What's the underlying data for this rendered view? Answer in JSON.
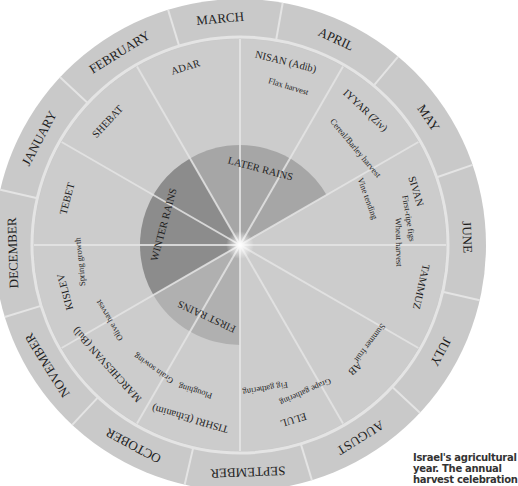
{
  "title": "Israel's agricultural year",
  "geometry": {
    "cx": 240,
    "cy": 245,
    "outer_r": 246,
    "ring_r": 206,
    "rain_r": 100
  },
  "colors": {
    "outer_ring": "#c9c9c9",
    "inner_ring": "#cccccc",
    "divider": "#e4e4e4",
    "later_rains": "#a6a6a6",
    "winter_rains": "#8c8c8c",
    "first_rains": "#b0b0b0",
    "text": "#1e1e1e"
  },
  "months": [
    {
      "label": "MARCH",
      "angle": -5
    },
    {
      "label": "APRIL",
      "angle": 25
    },
    {
      "label": "MAY",
      "angle": 56
    },
    {
      "label": "JUNE",
      "angle": 88
    },
    {
      "label": "JULY",
      "angle": 118
    },
    {
      "label": "AUGUST",
      "angle": 148
    },
    {
      "label": "SEPTEMBER",
      "angle": 178
    },
    {
      "label": "OCTOBER",
      "angle": 208
    },
    {
      "label": "NOVEMBER",
      "angle": 238
    },
    {
      "label": "DECEMBER",
      "angle": 268
    },
    {
      "label": "JANUARY",
      "angle": 298
    },
    {
      "label": "FEBRUARY",
      "angle": 328
    }
  ],
  "hebrew_months": [
    {
      "label": "NISAN (Adib)",
      "angle": 14,
      "r": 188
    },
    {
      "label": "IYYAR (Ziv)",
      "angle": 43,
      "r": 183
    },
    {
      "label": "SIVAN",
      "angle": 73,
      "r": 183
    },
    {
      "label": "TAMMUZ",
      "angle": 103,
      "r": 185
    },
    {
      "label": "AB",
      "angle": 137,
      "r": 168
    },
    {
      "label": "ELUL",
      "angle": 163,
      "r": 182
    },
    {
      "label": "TISHRI (Ethanim)",
      "angle": 196,
      "r": 180
    },
    {
      "label": "MARCHESVAN (Bul)",
      "angle": 228,
      "r": 178
    },
    {
      "label": "KISLEV",
      "angle": 255,
      "r": 180
    },
    {
      "label": "TEBET",
      "angle": 285,
      "r": 178
    },
    {
      "label": "SHEBAT",
      "angle": 313,
      "r": 180
    },
    {
      "label": "ADAR",
      "angle": 343,
      "r": 185
    }
  ],
  "activities": [
    {
      "label": "Flax harvest",
      "angle": 17,
      "r": 165
    },
    {
      "label": "Cereal/Barley harvest",
      "angle": 50,
      "r": 150
    },
    {
      "label": "Vine tending",
      "angle": 70,
      "r": 135
    },
    {
      "label": "First-ripe figs",
      "angle": 81,
      "r": 170
    },
    {
      "label": "Wheat harvest",
      "angle": 89,
      "r": 158
    },
    {
      "label": "Summer fruit",
      "angle": 127,
      "r": 162
    },
    {
      "label": "Grape gathering",
      "angle": 156,
      "r": 160
    },
    {
      "label": "Fig gathering",
      "angle": 170,
      "r": 145
    },
    {
      "label": "Ploughing",
      "angle": 197,
      "r": 152
    },
    {
      "label": "Grain sowing",
      "angle": 215,
      "r": 150
    },
    {
      "label": "Olive harvest",
      "angle": 240,
      "r": 150
    },
    {
      "label": "Spring growth",
      "angle": 264,
      "r": 160
    }
  ],
  "rains": [
    {
      "label": "LATER RAINS",
      "start": 330,
      "end": 60,
      "label_angle": 15,
      "color_key": "later_rains"
    },
    {
      "label": "WINTER RAINS",
      "start": 240,
      "end": 330,
      "label_angle": 285,
      "color_key": "winter_rains"
    },
    {
      "label": "FIRST RAINS",
      "start": 180,
      "end": 240,
      "label_angle": 205,
      "color_key": "first_rains"
    }
  ],
  "caption_lines": [
    "Israel's agricultural",
    "year. The annual",
    "harvest celebration"
  ]
}
